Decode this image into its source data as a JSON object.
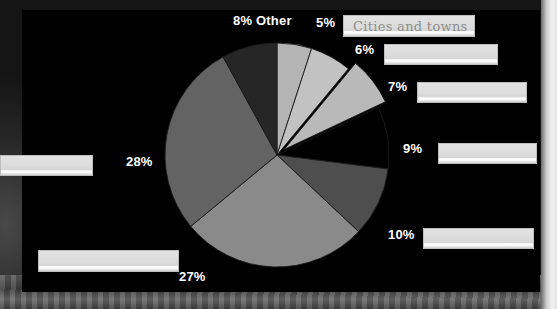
{
  "slide": {
    "background_description": "grayscale landscape photograph",
    "panel_color": "#000000"
  },
  "chart_data": {
    "type": "pie",
    "title": "",
    "legend_position": "around",
    "categories": [
      "5%",
      "6%",
      "7%",
      "9%",
      "10%",
      "27%",
      "28%",
      "Other"
    ],
    "values": [
      5,
      6,
      7,
      9,
      10,
      27,
      28,
      8
    ],
    "labels": [
      "5%",
      "6%",
      "7%",
      "9%",
      "10%",
      "27%",
      "28%",
      "8% Other"
    ],
    "colors": [
      "#b4b4b4",
      "#c2c2c2",
      "#b9b9b9",
      "#000000",
      "#4e4e4e",
      "#8a8a8a",
      "#636363",
      "#262626"
    ],
    "exploded": [
      false,
      false,
      true,
      false,
      false,
      false,
      false,
      false
    ],
    "slice_names": [
      "slice-5",
      "slice-6",
      "slice-7",
      "slice-9",
      "slice-10",
      "slice-27",
      "slice-28",
      "slice-other"
    ],
    "start_angle_deg": -90,
    "direction": "clockwise",
    "total": 100
  },
  "labels": {
    "other": "8% Other",
    "p5": "5%",
    "p6": "6%",
    "p7": "7%",
    "p9": "9%",
    "p10": "10%",
    "p27": "27%",
    "p28": "28%"
  },
  "legend": {
    "items": [
      {
        "name": "legend-cities-and-towns",
        "text": "Cities and towns",
        "pct": "5%"
      },
      {
        "name": "legend-item-6",
        "text": "",
        "pct": "6%"
      },
      {
        "name": "legend-item-7",
        "text": "",
        "pct": "7%"
      },
      {
        "name": "legend-item-9",
        "text": "",
        "pct": "9%"
      },
      {
        "name": "legend-item-10",
        "text": "",
        "pct": "10%"
      },
      {
        "name": "legend-item-27",
        "text": "",
        "pct": "27%"
      },
      {
        "name": "legend-item-28",
        "text": "",
        "pct": "28%"
      }
    ]
  },
  "colors": {
    "panel": "#000000",
    "label_text": "#ffffff",
    "legend_fill": "#dcdcdc",
    "legend_text": "#8e8e8e"
  }
}
